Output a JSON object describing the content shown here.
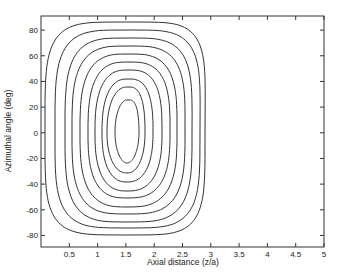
{
  "chart_data": {
    "type": "contour",
    "title": "",
    "xlabel": "Axial distance (z/a)",
    "ylabel": "Azimuthal angle (deg)",
    "xlim": [
      0,
      5
    ],
    "ylim": [
      -89,
      91
    ],
    "xticks": [
      0.5,
      1,
      1.5,
      2,
      2.5,
      3,
      3.5,
      4,
      4.5,
      5
    ],
    "xtick_labels": [
      "0.5",
      "1",
      "1.5",
      "2",
      "2.5",
      "3",
      "3.5",
      "4",
      "4.5",
      "5"
    ],
    "yticks": [
      80,
      60,
      40,
      20,
      0,
      -20,
      -40,
      -60,
      -80
    ],
    "ytick_labels": [
      "80",
      "60",
      "40",
      "20",
      "0",
      "-20",
      "-40",
      "-60",
      "-80"
    ],
    "grid": false,
    "legend": null,
    "center": {
      "x": 1.52,
      "y": 0
    },
    "contours": [
      {
        "level": 1,
        "x_left": 0.15,
        "x_right": 2.93,
        "y_top": 85,
        "y_bottom": -80
      },
      {
        "level": 2,
        "x_left": 0.49,
        "x_right": 2.76,
        "y_top": 79,
        "y_bottom": -75
      },
      {
        "level": 3,
        "x_left": 0.85,
        "x_right": 2.65,
        "y_top": 73,
        "y_bottom": -70
      },
      {
        "level": 4,
        "x_left": 0.55,
        "x_right": 2.53,
        "y_top": 67,
        "y_bottom": -64
      },
      {
        "level": 5,
        "x_left": 0.69,
        "x_right": 2.39,
        "y_top": 61,
        "y_bottom": -58
      },
      {
        "level": 6,
        "x_left": 0.83,
        "x_right": 2.27,
        "y_top": 54,
        "y_bottom": -51
      },
      {
        "level": 7,
        "x_left": 0.95,
        "x_right": 2.13,
        "y_top": 48,
        "y_bottom": -46
      },
      {
        "level": 8,
        "x_left": 1.08,
        "x_right": 1.97,
        "y_top": 41,
        "y_bottom": -39
      },
      {
        "level": 9,
        "x_left": 1.17,
        "x_right": 1.83,
        "y_top": 35,
        "y_bottom": -32
      },
      {
        "level": 10,
        "x_left": 1.31,
        "x_right": 1.73,
        "y_top": 25,
        "y_bottom": -24
      }
    ],
    "colors": {
      "line": "#333333",
      "axes": "#333333",
      "background": "#ffffff"
    }
  }
}
